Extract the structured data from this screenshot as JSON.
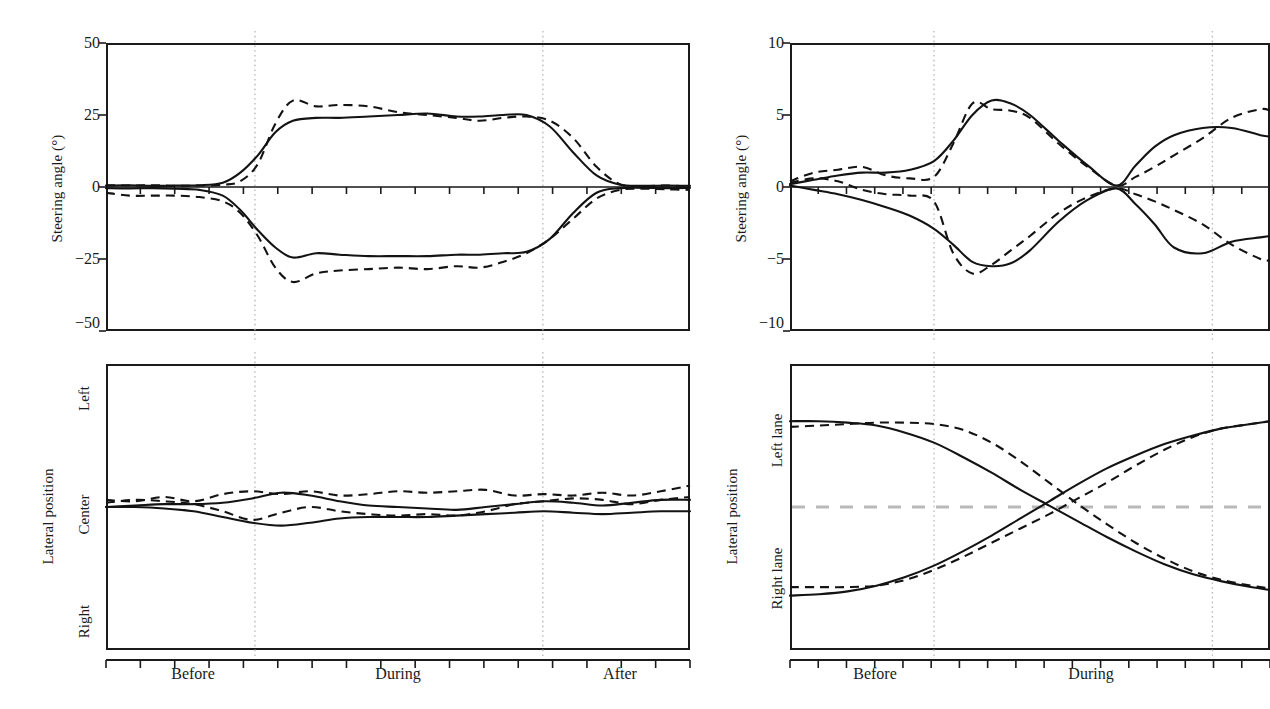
{
  "figure": {
    "panels": [
      "top-left",
      "top-right",
      "bottom-left",
      "bottom-right"
    ],
    "note_right_column_cropped": "true"
  },
  "panel_tl": {
    "ylabel": "Steering angle (°)",
    "yticks": [
      "50",
      "25",
      "0",
      "−25",
      "−50"
    ]
  },
  "panel_tr": {
    "ylabel": "Steering angle (°)",
    "yticks": [
      "10",
      "5",
      "0",
      "−5",
      "−10"
    ]
  },
  "panel_bl": {
    "ylabel": "Lateral position",
    "ycats": [
      "Left",
      "Center",
      "Right"
    ],
    "xticks": [
      "Before",
      "During",
      "After"
    ]
  },
  "panel_br": {
    "ylabel": "Lateral position",
    "ycats": [
      "Left lane",
      "Right lane"
    ],
    "xticks": [
      "Before",
      "During"
    ]
  },
  "colors": {
    "curve": "#131313",
    "gridline": "#bdbdbd",
    "lane_marker": "#b9b9b9",
    "axis": "#1b1b1b"
  },
  "chart_data": [
    {
      "id": "panel_tl",
      "type": "line",
      "title": "",
      "xlabel": "",
      "ylabel": "Steering angle (°)",
      "ylim": [
        -50,
        50
      ],
      "yticks": [
        50,
        25,
        0,
        -25,
        -50
      ],
      "ytick_labels": [
        "50",
        "25",
        "0",
        "−25",
        "−50"
      ],
      "xlim": [
        0,
        1
      ],
      "x_categories": [
        "Before",
        "During",
        "After"
      ],
      "x_category_positions": [
        0.145,
        0.5,
        0.875
      ],
      "phase_boundaries": [
        0.255,
        0.748
      ],
      "grid": false,
      "legend": "none",
      "series": [
        {
          "name": "left-turn solid",
          "style": "solid",
          "x": [
            0.0,
            0.04,
            0.08,
            0.12,
            0.16,
            0.2,
            0.23,
            0.26,
            0.29,
            0.32,
            0.36,
            0.4,
            0.45,
            0.5,
            0.55,
            0.6,
            0.64,
            0.68,
            0.72,
            0.76,
            0.8,
            0.84,
            0.88,
            0.92,
            0.96,
            1.0
          ],
          "y": [
            0.5,
            0.6,
            0.4,
            0.5,
            0.6,
            1.5,
            5.0,
            11.0,
            19.0,
            23.0,
            24.0,
            24.0,
            24.5,
            25.0,
            25.5,
            24.5,
            24.5,
            25.0,
            25.0,
            21.0,
            12.0,
            4.0,
            0.8,
            0.4,
            0.5,
            0.4
          ]
        },
        {
          "name": "left-turn dashed",
          "style": "dashed",
          "x": [
            0.0,
            0.04,
            0.08,
            0.12,
            0.16,
            0.2,
            0.23,
            0.26,
            0.29,
            0.32,
            0.36,
            0.4,
            0.45,
            0.5,
            0.55,
            0.6,
            0.64,
            0.68,
            0.72,
            0.76,
            0.8,
            0.84,
            0.88,
            0.92,
            0.96,
            1.0
          ],
          "y": [
            0.6,
            0.5,
            0.6,
            0.4,
            0.5,
            0.8,
            2.0,
            8.0,
            22.0,
            30.0,
            28.0,
            28.5,
            28.0,
            26.0,
            25.0,
            24.0,
            23.0,
            24.0,
            24.5,
            23.0,
            17.0,
            7.0,
            1.0,
            0.3,
            0.5,
            0.2
          ]
        },
        {
          "name": "right-turn solid",
          "style": "solid",
          "x": [
            0.0,
            0.04,
            0.08,
            0.12,
            0.16,
            0.2,
            0.23,
            0.26,
            0.29,
            0.32,
            0.36,
            0.4,
            0.45,
            0.5,
            0.55,
            0.6,
            0.64,
            0.68,
            0.72,
            0.76,
            0.8,
            0.84,
            0.88,
            0.92,
            0.96,
            1.0
          ],
          "y": [
            -0.4,
            -0.5,
            -0.4,
            -0.6,
            -1.0,
            -3.0,
            -8.0,
            -15.0,
            -21.0,
            -24.5,
            -23.0,
            -23.5,
            -24.0,
            -24.0,
            -24.0,
            -23.5,
            -23.5,
            -23.0,
            -22.5,
            -18.0,
            -9.0,
            -2.0,
            -0.4,
            -0.3,
            -0.4,
            -0.3
          ]
        },
        {
          "name": "right-turn dashed",
          "style": "dashed",
          "x": [
            0.0,
            0.04,
            0.08,
            0.12,
            0.16,
            0.2,
            0.23,
            0.26,
            0.29,
            0.32,
            0.36,
            0.4,
            0.45,
            0.5,
            0.55,
            0.6,
            0.64,
            0.68,
            0.72,
            0.76,
            0.8,
            0.84,
            0.88,
            0.92,
            0.96,
            1.0
          ],
          "y": [
            -2.0,
            -3.0,
            -3.0,
            -3.0,
            -3.5,
            -5.0,
            -9.0,
            -17.0,
            -28.0,
            -33.0,
            -30.0,
            -29.0,
            -28.5,
            -28.0,
            -28.5,
            -27.5,
            -28.0,
            -26.0,
            -23.0,
            -18.0,
            -11.0,
            -4.0,
            -1.0,
            -0.6,
            -0.8,
            -1.0
          ]
        }
      ]
    },
    {
      "id": "panel_tr",
      "type": "line",
      "title": "",
      "xlabel": "",
      "ylabel": "Steering angle (°)",
      "ylim": [
        -10,
        10
      ],
      "yticks": [
        10,
        5,
        0,
        -5,
        -10
      ],
      "ytick_labels": [
        "10",
        "5",
        "0",
        "−5",
        "−10"
      ],
      "xlim": [
        0,
        1
      ],
      "x_categories": [
        "Before",
        "During"
      ],
      "x_category_positions": [
        0.16,
        0.62
      ],
      "phase_boundaries": [
        0.3,
        0.88
      ],
      "grid": false,
      "legend": "none",
      "series": [
        {
          "name": "maneuver-A solid",
          "style": "solid",
          "x": [
            0.0,
            0.05,
            0.1,
            0.15,
            0.2,
            0.25,
            0.3,
            0.34,
            0.38,
            0.42,
            0.46,
            0.5,
            0.56,
            0.62,
            0.68,
            0.72,
            0.76,
            0.8,
            0.86,
            0.92,
            0.98,
            1.0
          ],
          "y": [
            0.2,
            0.5,
            0.8,
            1.0,
            1.0,
            1.2,
            1.8,
            3.2,
            5.0,
            6.0,
            5.8,
            5.0,
            3.2,
            1.5,
            0.1,
            1.5,
            2.8,
            3.6,
            4.1,
            4.1,
            3.6,
            3.5
          ]
        },
        {
          "name": "maneuver-A dashed",
          "style": "dashed",
          "x": [
            0.0,
            0.05,
            0.1,
            0.15,
            0.2,
            0.25,
            0.3,
            0.34,
            0.38,
            0.42,
            0.46,
            0.5,
            0.56,
            0.62,
            0.68,
            0.72,
            0.76,
            0.8,
            0.86,
            0.92,
            0.98,
            1.0
          ],
          "y": [
            0.4,
            1.0,
            1.2,
            1.4,
            0.8,
            0.6,
            0.7,
            3.0,
            5.8,
            5.4,
            5.3,
            4.8,
            3.0,
            1.4,
            0.1,
            0.7,
            1.4,
            2.2,
            3.4,
            4.8,
            5.4,
            5.3
          ]
        },
        {
          "name": "maneuver-B solid",
          "style": "solid",
          "x": [
            0.0,
            0.05,
            0.1,
            0.15,
            0.2,
            0.25,
            0.3,
            0.34,
            0.38,
            0.42,
            0.46,
            0.5,
            0.56,
            0.62,
            0.68,
            0.72,
            0.76,
            0.8,
            0.86,
            0.92,
            0.98,
            1.0
          ],
          "y": [
            0.1,
            -0.2,
            -0.5,
            -0.9,
            -1.4,
            -2.0,
            -2.9,
            -4.0,
            -5.2,
            -5.5,
            -5.3,
            -4.4,
            -2.4,
            -0.9,
            -0.1,
            -1.2,
            -2.6,
            -4.2,
            -4.6,
            -3.8,
            -3.5,
            -3.4
          ]
        },
        {
          "name": "maneuver-B dashed",
          "style": "dashed",
          "x": [
            0.0,
            0.05,
            0.1,
            0.15,
            0.2,
            0.25,
            0.3,
            0.34,
            0.38,
            0.42,
            0.46,
            0.5,
            0.56,
            0.62,
            0.68,
            0.72,
            0.76,
            0.8,
            0.86,
            0.92,
            0.98,
            1.0
          ],
          "y": [
            0.3,
            0.6,
            0.4,
            -0.2,
            -0.5,
            -0.6,
            -1.0,
            -4.6,
            -6.0,
            -5.4,
            -4.4,
            -3.4,
            -1.8,
            -0.7,
            -0.1,
            -0.5,
            -1.0,
            -1.6,
            -2.6,
            -4.0,
            -5.0,
            -5.1
          ]
        }
      ]
    },
    {
      "id": "panel_bl",
      "type": "line",
      "title": "",
      "xlabel": "",
      "ylabel": "Lateral position",
      "ylim": [
        -1,
        1
      ],
      "ytick_labels": [
        "Left",
        "Center",
        "Right"
      ],
      "ytick_values": [
        0.62,
        0.0,
        -0.62
      ],
      "xlim": [
        0,
        1
      ],
      "x_categories": [
        "Before",
        "During",
        "After"
      ],
      "x_category_positions": [
        0.145,
        0.5,
        0.875
      ],
      "phase_boundaries": [
        0.255,
        0.748
      ],
      "grid": false,
      "legend": "none",
      "series": [
        {
          "name": "trace-1 solid",
          "style": "solid",
          "x": [
            0.0,
            0.05,
            0.1,
            0.15,
            0.2,
            0.25,
            0.3,
            0.35,
            0.4,
            0.45,
            0.5,
            0.55,
            0.6,
            0.65,
            0.7,
            0.75,
            0.8,
            0.85,
            0.9,
            0.95,
            1.0
          ],
          "y": [
            0.0,
            0.01,
            0.02,
            0.02,
            0.03,
            0.06,
            0.1,
            0.08,
            0.04,
            0.01,
            0.0,
            -0.01,
            -0.02,
            0.0,
            0.02,
            0.04,
            0.03,
            0.01,
            0.03,
            0.05,
            0.05
          ]
        },
        {
          "name": "trace-2 solid",
          "style": "solid",
          "x": [
            0.0,
            0.05,
            0.1,
            0.15,
            0.2,
            0.25,
            0.3,
            0.35,
            0.4,
            0.45,
            0.5,
            0.55,
            0.6,
            0.65,
            0.7,
            0.75,
            0.8,
            0.85,
            0.9,
            0.95,
            1.0
          ],
          "y": [
            0.0,
            0.0,
            -0.01,
            -0.03,
            -0.07,
            -0.11,
            -0.13,
            -0.11,
            -0.08,
            -0.07,
            -0.07,
            -0.07,
            -0.06,
            -0.05,
            -0.04,
            -0.03,
            -0.04,
            -0.05,
            -0.04,
            -0.03,
            -0.03
          ]
        },
        {
          "name": "trace-3 dashed",
          "style": "dashed",
          "x": [
            0.0,
            0.05,
            0.1,
            0.15,
            0.2,
            0.25,
            0.3,
            0.35,
            0.4,
            0.45,
            0.5,
            0.55,
            0.6,
            0.65,
            0.7,
            0.75,
            0.8,
            0.85,
            0.9,
            0.95,
            1.0
          ],
          "y": [
            0.05,
            0.04,
            0.07,
            0.04,
            0.09,
            0.11,
            0.09,
            0.11,
            0.08,
            0.09,
            0.11,
            0.1,
            0.11,
            0.12,
            0.08,
            0.09,
            0.08,
            0.1,
            0.08,
            0.11,
            0.15
          ]
        },
        {
          "name": "trace-4 dashed",
          "style": "dashed",
          "x": [
            0.0,
            0.05,
            0.1,
            0.15,
            0.2,
            0.25,
            0.3,
            0.35,
            0.4,
            0.45,
            0.5,
            0.55,
            0.6,
            0.65,
            0.7,
            0.75,
            0.8,
            0.85,
            0.9,
            0.95,
            1.0
          ],
          "y": [
            0.03,
            0.05,
            0.04,
            0.02,
            -0.03,
            -0.09,
            -0.04,
            0.0,
            -0.03,
            -0.05,
            -0.06,
            -0.05,
            -0.06,
            -0.03,
            0.02,
            0.04,
            0.06,
            0.05,
            0.02,
            0.05,
            0.07
          ]
        }
      ]
    },
    {
      "id": "panel_br",
      "type": "line",
      "title": "",
      "xlabel": "",
      "ylabel": "Lateral position",
      "ylim": [
        -1,
        1
      ],
      "ytick_labels": [
        "Left lane",
        "Right lane"
      ],
      "ytick_values": [
        0.45,
        -0.45
      ],
      "lane_marker_y": 0.0,
      "xlim": [
        0,
        1
      ],
      "x_categories": [
        "Before",
        "During"
      ],
      "x_category_positions": [
        0.16,
        0.62
      ],
      "phase_boundaries": [
        0.3,
        0.88
      ],
      "grid": false,
      "legend": "none",
      "series": [
        {
          "name": "lane-change-LR solid",
          "style": "solid",
          "x": [
            0.0,
            0.06,
            0.12,
            0.18,
            0.24,
            0.3,
            0.36,
            0.42,
            0.48,
            0.54,
            0.6,
            0.66,
            0.72,
            0.78,
            0.84,
            0.9,
            0.96,
            1.0
          ],
          "y": [
            0.6,
            0.6,
            0.59,
            0.57,
            0.52,
            0.45,
            0.35,
            0.24,
            0.12,
            0.01,
            -0.1,
            -0.21,
            -0.31,
            -0.4,
            -0.47,
            -0.52,
            -0.56,
            -0.58
          ]
        },
        {
          "name": "lane-change-LR dashed",
          "style": "dashed",
          "x": [
            0.0,
            0.06,
            0.12,
            0.18,
            0.24,
            0.3,
            0.36,
            0.42,
            0.48,
            0.54,
            0.6,
            0.66,
            0.72,
            0.78,
            0.84,
            0.9,
            0.96,
            1.0
          ],
          "y": [
            0.56,
            0.57,
            0.58,
            0.59,
            0.59,
            0.58,
            0.54,
            0.45,
            0.32,
            0.17,
            0.02,
            -0.12,
            -0.25,
            -0.36,
            -0.45,
            -0.51,
            -0.55,
            -0.57
          ]
        },
        {
          "name": "lane-change-RL solid",
          "style": "solid",
          "x": [
            0.0,
            0.06,
            0.12,
            0.18,
            0.24,
            0.3,
            0.36,
            0.42,
            0.48,
            0.54,
            0.6,
            0.66,
            0.72,
            0.78,
            0.84,
            0.9,
            0.96,
            1.0
          ],
          "y": [
            -0.62,
            -0.61,
            -0.59,
            -0.55,
            -0.49,
            -0.41,
            -0.31,
            -0.2,
            -0.08,
            0.04,
            0.16,
            0.27,
            0.36,
            0.44,
            0.5,
            0.55,
            0.58,
            0.6
          ]
        },
        {
          "name": "lane-change-RL dashed",
          "style": "dashed",
          "x": [
            0.0,
            0.06,
            0.12,
            0.18,
            0.24,
            0.3,
            0.36,
            0.42,
            0.48,
            0.54,
            0.6,
            0.66,
            0.72,
            0.78,
            0.84,
            0.9,
            0.96,
            1.0
          ],
          "y": [
            -0.56,
            -0.56,
            -0.56,
            -0.55,
            -0.51,
            -0.44,
            -0.35,
            -0.25,
            -0.15,
            -0.05,
            0.06,
            0.17,
            0.29,
            0.4,
            0.49,
            0.55,
            0.58,
            0.6
          ]
        }
      ]
    }
  ]
}
